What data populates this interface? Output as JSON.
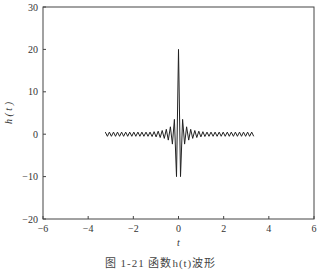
{
  "chart_data": {
    "type": "line",
    "title": "",
    "xlabel": "t",
    "ylabel": "h ( t )",
    "xlim": [
      -6,
      6
    ],
    "ylim": [
      -20,
      30
    ],
    "x_ticks": [
      "-6",
      "-4",
      "-2",
      "0",
      "2",
      "4",
      "6"
    ],
    "y_ticks": [
      "30",
      "20",
      "10",
      "0",
      "-10",
      "-20"
    ],
    "grid": false,
    "legend": null,
    "series": [
      {
        "name": "h(t)",
        "description": "sinc-like impulse response centered at t=0",
        "t_range": [
          -3.3,
          3.4
        ],
        "peak_value": 20,
        "peak_t": 0,
        "first_minima": [
          {
            "t": -0.15,
            "value": -10
          },
          {
            "t": 0.15,
            "value": -10
          }
        ],
        "first_side_peaks": [
          {
            "t": -0.3,
            "value": 3.5
          },
          {
            "t": 0.3,
            "value": 3.5
          }
        ],
        "tail_amplitude": 0.5,
        "oscillation_period": 0.18,
        "color": "#222222"
      }
    ]
  },
  "caption": "图 1-21   函数h(t)波形"
}
